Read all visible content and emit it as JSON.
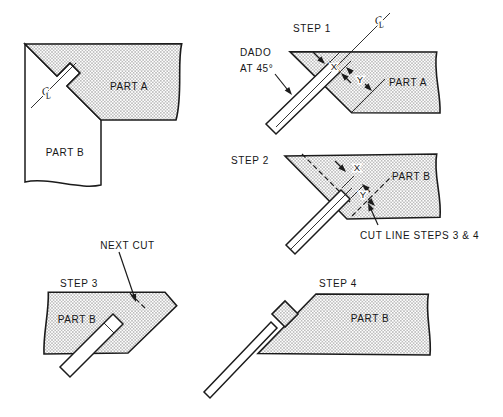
{
  "colors": {
    "background": "#ffffff",
    "line": "#1b1b1b",
    "hatch_dot": "#9f9f9f",
    "hatch_tone": "#d4d4d4"
  },
  "assembled": {
    "part_a": "PART A",
    "part_b": "PART B",
    "centerline_c": "C",
    "centerline_l": "L"
  },
  "step1": {
    "title": "STEP 1",
    "dado_label_line1": "DADO",
    "dado_label_line2": "AT 45°",
    "part_label": "PART A",
    "dim_x": "X",
    "dim_y": "Y",
    "centerline_c": "C",
    "centerline_l": "L"
  },
  "step2": {
    "title": "STEP 2",
    "part_label": "PART B",
    "dim_x": "X",
    "dim_y": "Y",
    "cut_line_label": "CUT LINE STEPS 3 & 4"
  },
  "step3": {
    "title": "STEP 3",
    "part_label": "PART B",
    "next_cut_label": "NEXT CUT"
  },
  "step4": {
    "title": "STEP 4",
    "part_label": "PART B"
  }
}
